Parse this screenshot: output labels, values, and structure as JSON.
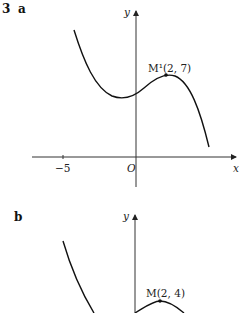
{
  "question": {
    "number": "3",
    "parts": [
      {
        "label": "a",
        "axes": {
          "x_label": "x",
          "y_label": "y",
          "origin_label": "O",
          "x_tick_label": "−5"
        },
        "point": {
          "label": "M¹(2, 7)",
          "x": 2,
          "y": 7
        }
      },
      {
        "label": "b",
        "axes": {
          "y_label": "y"
        },
        "point": {
          "label": "M(2, 4)",
          "x": 2,
          "y": 4
        }
      }
    ]
  },
  "colors": {
    "curve": "#111111",
    "axis": "#333333",
    "background": "#ffffff"
  }
}
